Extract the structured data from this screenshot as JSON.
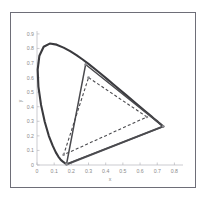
{
  "figure": {
    "name": "cie-chromaticity-diagram",
    "background_color": "#ffffff",
    "frame_color": "#6e6e78"
  },
  "chart_data": {
    "type": "line",
    "title": "",
    "xlabel": "x",
    "ylabel": "y",
    "xlim": [
      0,
      0.85
    ],
    "ylim": [
      0,
      0.92
    ],
    "grid": false,
    "legend": "none",
    "xticks": [
      "0",
      "0.1",
      "0.2",
      "0.3",
      "0.4",
      "0.5",
      "0.6",
      "0.7",
      "0.8"
    ],
    "xtick_values": [
      0,
      0.1,
      0.2,
      0.3,
      0.4,
      0.5,
      0.6,
      0.7,
      0.8
    ],
    "yticks": [
      "0",
      "0.1",
      "0.2",
      "0.3",
      "0.4",
      "0.5",
      "0.6",
      "0.7",
      "0.8",
      "0.9"
    ],
    "ytick_values": [
      0,
      0.1,
      0.2,
      0.3,
      0.4,
      0.5,
      0.6,
      0.7,
      0.8,
      0.9
    ],
    "series": [
      {
        "name": "spectral-locus",
        "style": "solid",
        "color": "#58585c",
        "points": [
          [
            0.1741,
            0.005
          ],
          [
            0.174,
            0.005
          ],
          [
            0.1738,
            0.0049
          ],
          [
            0.1736,
            0.0049
          ],
          [
            0.1733,
            0.0048
          ],
          [
            0.173,
            0.0048
          ],
          [
            0.1726,
            0.0048
          ],
          [
            0.1721,
            0.0048
          ],
          [
            0.1714,
            0.0051
          ],
          [
            0.1703,
            0.0058
          ],
          [
            0.1689,
            0.0069
          ],
          [
            0.1669,
            0.0086
          ],
          [
            0.1644,
            0.0109
          ],
          [
            0.1611,
            0.0138
          ],
          [
            0.1566,
            0.0177
          ],
          [
            0.151,
            0.0227
          ],
          [
            0.144,
            0.0297
          ],
          [
            0.1355,
            0.0399
          ],
          [
            0.1241,
            0.0578
          ],
          [
            0.1096,
            0.0868
          ],
          [
            0.0913,
            0.1327
          ],
          [
            0.0687,
            0.2007
          ],
          [
            0.0454,
            0.295
          ],
          [
            0.0235,
            0.4127
          ],
          [
            0.0082,
            0.5384
          ],
          [
            0.0039,
            0.6548
          ],
          [
            0.0139,
            0.7502
          ],
          [
            0.0389,
            0.812
          ],
          [
            0.0743,
            0.8338
          ],
          [
            0.1142,
            0.8262
          ],
          [
            0.1547,
            0.8059
          ],
          [
            0.1929,
            0.7816
          ],
          [
            0.2296,
            0.7543
          ],
          [
            0.2658,
            0.7243
          ],
          [
            0.3016,
            0.6923
          ],
          [
            0.3373,
            0.6589
          ],
          [
            0.3731,
            0.6245
          ],
          [
            0.4087,
            0.5896
          ],
          [
            0.4441,
            0.5547
          ],
          [
            0.4788,
            0.5202
          ],
          [
            0.5125,
            0.4866
          ],
          [
            0.5448,
            0.4544
          ],
          [
            0.5752,
            0.4242
          ],
          [
            0.6029,
            0.3965
          ],
          [
            0.627,
            0.3725
          ],
          [
            0.6482,
            0.3514
          ],
          [
            0.6658,
            0.334
          ],
          [
            0.6801,
            0.3197
          ],
          [
            0.6915,
            0.3083
          ],
          [
            0.7006,
            0.2993
          ],
          [
            0.7079,
            0.292
          ],
          [
            0.714,
            0.2859
          ],
          [
            0.719,
            0.2809
          ],
          [
            0.723,
            0.277
          ],
          [
            0.726,
            0.274
          ],
          [
            0.7283,
            0.2717
          ],
          [
            0.73,
            0.27
          ],
          [
            0.7311,
            0.2689
          ],
          [
            0.732,
            0.268
          ],
          [
            0.7327,
            0.2673
          ],
          [
            0.7334,
            0.2666
          ],
          [
            0.734,
            0.266
          ],
          [
            0.7344,
            0.2656
          ],
          [
            0.7346,
            0.2654
          ]
        ]
      },
      {
        "name": "purple-line",
        "style": "solid",
        "color": "#58585c",
        "points": [
          [
            0.7346,
            0.2654
          ],
          [
            0.1741,
            0.005
          ]
        ]
      }
    ],
    "annotations": [
      {
        "name": "wide-gamut-triangle",
        "style": "solid",
        "color": "#4a4a4e",
        "vertices": [
          [
            0.283,
            0.69
          ],
          [
            0.735,
            0.265
          ],
          [
            0.172,
            0.006
          ]
        ],
        "vertex_labels": [
          "green-primary",
          "red-primary",
          "blue-primary"
        ]
      },
      {
        "name": "srgb-gamut-triangle",
        "style": "dashed",
        "color": "#4a4a4e",
        "vertices": [
          [
            0.3,
            0.6
          ],
          [
            0.64,
            0.33
          ],
          [
            0.155,
            0.07
          ]
        ],
        "vertex_labels": [
          "green-primary",
          "red-primary",
          "blue-primary"
        ]
      }
    ]
  }
}
